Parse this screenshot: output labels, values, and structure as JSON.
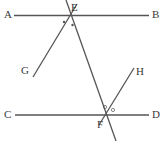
{
  "figure": {
    "width": 165,
    "height": 141,
    "background_color": "#ffffff",
    "stroke_color": "#555555",
    "label_color": "#3a3a3a",
    "mark_color": "#555555"
  },
  "labels": {
    "A": "A",
    "B": "B",
    "C": "C",
    "D": "D",
    "E": "E",
    "F": "F",
    "G": "G",
    "H": "H"
  },
  "label_positions": {
    "A": {
      "x": 4,
      "y": 9
    },
    "B": {
      "x": 152,
      "y": 9
    },
    "C": {
      "x": 4,
      "y": 109
    },
    "D": {
      "x": 152,
      "y": 109
    },
    "E": {
      "x": 71,
      "y": 2
    },
    "F": {
      "x": 97,
      "y": 119
    },
    "G": {
      "x": 21,
      "y": 65
    },
    "H": {
      "x": 136,
      "y": 66
    }
  },
  "points": {
    "E": {
      "x": 70,
      "y": 15.5
    },
    "F": {
      "x": 104,
      "y": 115
    }
  },
  "lines": [
    {
      "name": "line-AB",
      "from_label": "A",
      "to_label": "B",
      "x1": 14,
      "y1": 15.5,
      "x2": 149,
      "y2": 15.5
    },
    {
      "name": "line-CD",
      "from_label": "C",
      "to_label": "D",
      "x1": 15,
      "y1": 115,
      "x2": 149,
      "y2": 115
    },
    {
      "name": "line-GE",
      "from_label": "G",
      "to_label": "E",
      "x1": 33,
      "y1": 77,
      "x2": 77,
      "y2": 4
    },
    {
      "name": "line-EF",
      "from_label": "E",
      "to_label": "F",
      "x1": 66,
      "y1": 0,
      "x2": 116,
      "y2": 141
    },
    {
      "name": "line-FH",
      "from_label": "F",
      "to_label": "H",
      "x1": 99,
      "y1": 125,
      "x2": 134,
      "y2": 68
    }
  ],
  "angle_marks": {
    "at_E": [
      {
        "name": "angle-dot-e-left",
        "x": 64,
        "y": 22,
        "r": 1.2,
        "filled": true
      },
      {
        "name": "angle-dot-e-right",
        "x": 72.5,
        "y": 25,
        "r": 1.2,
        "filled": true
      }
    ],
    "at_F": [
      {
        "name": "angle-circle-f-left",
        "x": 105,
        "y": 107,
        "r": 1.6,
        "filled": false
      },
      {
        "name": "angle-circle-f-right",
        "x": 113,
        "y": 110,
        "r": 1.6,
        "filled": false
      }
    ]
  }
}
